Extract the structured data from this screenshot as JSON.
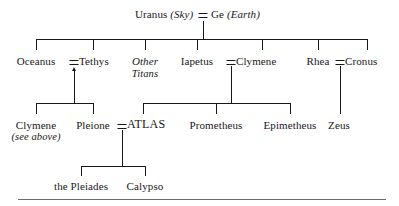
{
  "diagram": {
    "title_node": {
      "father": "Uranus",
      "father_epithet": "(Sky)",
      "marriage_symbol": "=",
      "mother": "Ge",
      "mother_epithet": "(Earth)"
    },
    "generation_2": [
      {
        "id": "oceanus",
        "label": "Oceanus"
      },
      {
        "id": "tethys",
        "label": "Tethys"
      },
      {
        "id": "other-titans",
        "label": "Other",
        "label_line2": "Titans",
        "italic": true
      },
      {
        "id": "iapetus",
        "label": "Iapetus"
      },
      {
        "id": "clymene",
        "label": "Clymene"
      },
      {
        "id": "rhea",
        "label": "Rhea"
      },
      {
        "id": "cronus",
        "label": "Cronus"
      }
    ],
    "generation_3": [
      {
        "id": "clymene-ref",
        "label": "Clymene",
        "note": "(see above)"
      },
      {
        "id": "pleione",
        "label": "Pleione"
      },
      {
        "id": "atlas",
        "label": "ATLAS"
      },
      {
        "id": "prometheus",
        "label": "Prometheus"
      },
      {
        "id": "epimetheus",
        "label": "Epimetheus"
      },
      {
        "id": "zeus",
        "label": "Zeus"
      }
    ],
    "generation_4": [
      {
        "id": "the-pleiades",
        "label": "the Pleiades"
      },
      {
        "id": "calypso",
        "label": "Calypso"
      }
    ],
    "marriage_symbols": {
      "oceanus_tethys": "=",
      "iapetus_clymene": "=",
      "rhea_cronus": "=",
      "pleione_atlas": "="
    },
    "colors": {
      "ink": "#17171a",
      "rule": "#6b6b70",
      "background": "#ffffff"
    }
  }
}
